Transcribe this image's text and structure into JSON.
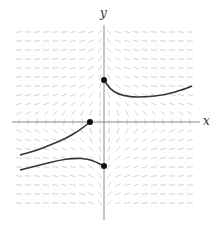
{
  "diagram": {
    "type": "slope_field",
    "axes": {
      "x_label": "x",
      "y_label": "y",
      "axis_color": "#8a8a8a",
      "origin_px": [
        104,
        122
      ],
      "x_range_px": [
        12,
        200
      ],
      "y_range_px": [
        25,
        220
      ]
    },
    "field": {
      "color": "#c8c8c8",
      "cols": 20,
      "rows": 20,
      "x0_px": 19,
      "y0_px": 32,
      "spacing_px": 9,
      "segment_length_px": 6,
      "slope_model": "-1/(x*y)"
    },
    "curves": [
      {
        "name": "upper-right-solution",
        "color": "#333333",
        "points": [
          [
            104,
            80
          ],
          [
            110,
            89
          ],
          [
            118,
            94
          ],
          [
            130,
            97
          ],
          [
            145,
            97
          ],
          [
            165,
            95
          ],
          [
            185,
            89
          ],
          [
            192,
            86
          ]
        ],
        "dot": [
          104,
          80
        ]
      },
      {
        "name": "upper-left-solution",
        "color": "#333333",
        "points": [
          [
            90,
            122
          ],
          [
            80,
            130
          ],
          [
            65,
            139
          ],
          [
            50,
            145
          ],
          [
            38,
            150
          ],
          [
            20,
            155
          ]
        ],
        "dot": [
          90,
          122
        ]
      },
      {
        "name": "lower-left-solution",
        "color": "#333333",
        "points": [
          [
            20,
            170
          ],
          [
            40,
            165
          ],
          [
            60,
            160
          ],
          [
            75,
            158
          ],
          [
            88,
            159
          ],
          [
            96,
            162
          ],
          [
            104,
            166
          ]
        ],
        "dot": [
          104,
          166
        ]
      }
    ]
  }
}
